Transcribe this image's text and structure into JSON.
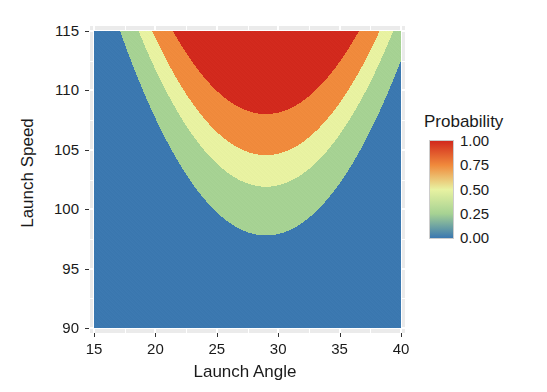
{
  "chart_data": {
    "type": "heatmap",
    "title": "",
    "subtitle": "",
    "xlabel": "Launch Angle",
    "ylabel": "Launch  Speed",
    "xlim": [
      15,
      40
    ],
    "ylim": [
      90,
      115
    ],
    "xticks": [
      15,
      20,
      25,
      30,
      35,
      40
    ],
    "yticks": [
      90,
      95,
      100,
      105,
      110,
      115
    ],
    "xticklabels": [
      "15",
      "20",
      "25",
      "30",
      "35",
      "40"
    ],
    "yticklabels": [
      "90",
      "95",
      "100",
      "105",
      "110",
      "115"
    ],
    "grid": true,
    "grid_color": "#ffffff",
    "panel_background": "#ebebeb",
    "legend": {
      "title": "Probability",
      "position": "right",
      "type": "continuous-colorbar",
      "limits": [
        0.0,
        1.0
      ],
      "breaks": [
        0.0,
        0.25,
        0.5,
        0.75,
        1.0
      ],
      "labels": [
        "0.00",
        "0.25",
        "0.50",
        "0.75",
        "1.00"
      ],
      "gradient_stops": [
        {
          "value": 0.0,
          "color": "#3b78b0"
        },
        {
          "value": 0.25,
          "color": "#a6d293"
        },
        {
          "value": 0.5,
          "color": "#e8f2a1"
        },
        {
          "value": 0.75,
          "color": "#f08a3c"
        },
        {
          "value": 1.0,
          "color": "#d2291d"
        }
      ]
    },
    "bands": [
      {
        "label": "0.00",
        "range": [
          0.0,
          0.1
        ],
        "color": "#3b78b0"
      },
      {
        "label": "0.25",
        "range": [
          0.1,
          0.35
        ],
        "color": "#a6d293"
      },
      {
        "label": "0.50",
        "range": [
          0.35,
          0.6
        ],
        "color": "#e8f2a1"
      },
      {
        "label": "0.75",
        "range": [
          0.6,
          0.85
        ],
        "color": "#f08a3c"
      },
      {
        "label": "1.00",
        "range": [
          0.85,
          1.0
        ],
        "color": "#d2291d"
      }
    ],
    "surface_model": {
      "optimal_angle": 29.0,
      "angle_width": 9.5,
      "speed_threshold_at_optimum": 103.5,
      "speed_scale": 2.6
    },
    "contour_levels": [
      0.1,
      0.35,
      0.6,
      0.85
    ],
    "samples": {
      "x": [
        15,
        20,
        25,
        30,
        35,
        40
      ],
      "y": [
        90,
        95,
        100,
        105,
        110,
        115
      ],
      "z": [
        [
          0.0,
          0.0,
          0.0,
          0.0,
          0.0,
          0.0
        ],
        [
          0.0,
          0.0,
          0.02,
          0.05,
          0.01,
          0.0
        ],
        [
          0.0,
          0.05,
          0.3,
          0.42,
          0.22,
          0.02
        ],
        [
          0.01,
          0.28,
          0.78,
          0.9,
          0.7,
          0.2
        ],
        [
          0.06,
          0.62,
          0.97,
          0.99,
          0.95,
          0.55
        ],
        [
          0.18,
          0.88,
          1.0,
          1.0,
          1.0,
          0.85
        ]
      ]
    }
  }
}
